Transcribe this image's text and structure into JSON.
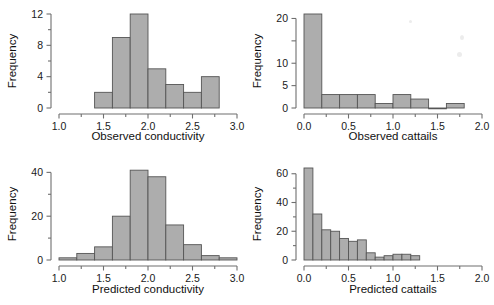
{
  "figure": {
    "background": "#ffffff",
    "bar_fill": "#adadad",
    "bar_stroke": "#555555",
    "axis_color": "#6f6f6f",
    "text_color": "#1a1a1a"
  },
  "chart_data": [
    {
      "id": "observed-conductivity",
      "type": "bar",
      "title": "",
      "xlabel": "Observed conductivity",
      "ylabel": "Frequency",
      "xlim": [
        1.0,
        3.0
      ],
      "ylim": [
        0,
        12
      ],
      "grid": false,
      "legend": "none",
      "xticks": [
        1.0,
        1.5,
        2.0,
        2.5,
        3.0
      ],
      "xticklabels": [
        "1.0",
        "1.5",
        "2.0",
        "2.5",
        "3.0"
      ],
      "xminorticks": [
        1.25,
        1.75,
        2.25,
        2.75
      ],
      "yticks": [
        0,
        4,
        8,
        12
      ],
      "yticklabels": [
        "0",
        "4",
        "8",
        "12"
      ],
      "yminorticks": [
        2,
        6,
        10
      ],
      "bin_width": 0.2,
      "bin_edges": [
        1.4,
        1.6,
        1.8,
        2.0,
        2.2,
        2.4,
        2.6,
        2.8
      ],
      "values": [
        2,
        9,
        12,
        5,
        3,
        2,
        4
      ]
    },
    {
      "id": "observed-cattails",
      "type": "bar",
      "title": "",
      "xlabel": "Observed cattails",
      "ylabel": "Frequency",
      "xlim": [
        0.0,
        2.0
      ],
      "ylim": [
        0,
        21
      ],
      "grid": false,
      "legend": "none",
      "xticks": [
        0.0,
        0.5,
        1.0,
        1.5,
        2.0
      ],
      "xticklabels": [
        "0.0",
        "0.5",
        "1.0",
        "1.5",
        "2.0"
      ],
      "xminorticks": [
        0.25,
        0.75,
        1.25,
        1.75
      ],
      "yticks": [
        0,
        5,
        10,
        15,
        20
      ],
      "yticklabels": [
        "0",
        "5",
        "10",
        "15",
        "20"
      ],
      "ylabelsshown": [
        "0",
        "5",
        "10",
        "20"
      ],
      "bin_width": 0.2,
      "bin_edges": [
        0.0,
        0.2,
        0.4,
        0.6,
        0.8,
        1.0,
        1.2,
        1.4,
        1.6,
        1.8
      ],
      "values": [
        21,
        3,
        3,
        3,
        1,
        3,
        2,
        0,
        1
      ]
    },
    {
      "id": "predicted-conductivity",
      "type": "bar",
      "title": "",
      "xlabel": "Predicted conductivity",
      "ylabel": "Frequency",
      "xlim": [
        1.0,
        3.0
      ],
      "ylim": [
        0,
        42
      ],
      "grid": false,
      "legend": "none",
      "xticks": [
        1.0,
        1.5,
        2.0,
        2.5,
        3.0
      ],
      "xticklabels": [
        "1.0",
        "1.5",
        "2.0",
        "2.5",
        "3.0"
      ],
      "xminorticks": [
        1.25,
        1.75,
        2.25,
        2.75
      ],
      "yticks": [
        0,
        20,
        40
      ],
      "yticklabels": [
        "0",
        "20",
        "40"
      ],
      "yminorticks": [
        10,
        30
      ],
      "bin_width": 0.2,
      "bin_edges": [
        1.0,
        1.2,
        1.4,
        1.6,
        1.8,
        2.0,
        2.2,
        2.4,
        2.6,
        2.8,
        3.0
      ],
      "values": [
        1,
        3,
        6,
        20,
        41,
        38,
        16,
        7,
        2,
        1
      ]
    },
    {
      "id": "predicted-cattails",
      "type": "bar",
      "title": "",
      "xlabel": "Predicted cattails",
      "ylabel": "Frequency",
      "xlim": [
        0.0,
        2.0
      ],
      "ylim": [
        0,
        64
      ],
      "grid": false,
      "legend": "none",
      "xticks": [
        0.0,
        0.5,
        1.0,
        1.5,
        2.0
      ],
      "xticklabels": [
        "0.0",
        "0.5",
        "1.0",
        "1.5",
        "2.0"
      ],
      "xminorticks": [
        0.25,
        0.75,
        1.25,
        1.75
      ],
      "yticks": [
        0,
        20,
        40,
        60
      ],
      "yticklabels": [
        "0",
        "20",
        "40",
        "60"
      ],
      "yminorticks": [
        10,
        30,
        50
      ],
      "bin_width": 0.1,
      "bin_edges": [
        0.0,
        0.1,
        0.2,
        0.3,
        0.4,
        0.5,
        0.6,
        0.7,
        0.8,
        0.9,
        1.0,
        1.1,
        1.2,
        1.3
      ],
      "values": [
        64,
        32,
        21,
        20,
        15,
        13,
        14,
        5,
        2,
        3,
        4,
        4,
        3
      ]
    }
  ]
}
